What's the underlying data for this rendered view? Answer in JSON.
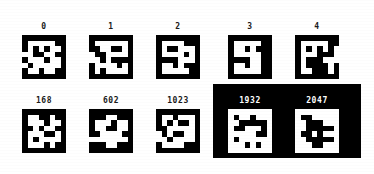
{
  "figure": {
    "background_color": "#ffffff",
    "foreground_color": "#000000",
    "panel_color": "#000000",
    "label_color": "#1a1a1a",
    "panel_label_color": "#ffffff",
    "tile_size_px": 44,
    "bit_grid": 8,
    "rows": 2,
    "columns": 5
  },
  "chart_data": {
    "type": "heatmap",
    "title": "",
    "xlabel": "",
    "ylabel": "",
    "grid": false,
    "legend": "none",
    "colormap": [
      "#000000",
      "#ffffff"
    ],
    "tiles": [
      {
        "label": "0",
        "index": 0,
        "row": 0,
        "column": 0,
        "inverted": false,
        "on_panel": false,
        "matrix": [
          [
            0,
            0,
            0,
            0,
            0,
            0,
            0,
            0
          ],
          [
            0,
            1,
            1,
            1,
            1,
            1,
            0,
            0
          ],
          [
            0,
            1,
            0,
            1,
            0,
            1,
            1,
            0
          ],
          [
            1,
            1,
            0,
            0,
            1,
            1,
            0,
            0
          ],
          [
            0,
            1,
            1,
            1,
            0,
            1,
            1,
            0
          ],
          [
            1,
            0,
            1,
            1,
            1,
            1,
            1,
            0
          ],
          [
            0,
            1,
            1,
            0,
            1,
            1,
            0,
            0
          ],
          [
            0,
            0,
            0,
            0,
            0,
            0,
            0,
            0
          ]
        ]
      },
      {
        "label": "1",
        "index": 1,
        "row": 0,
        "column": 1,
        "inverted": false,
        "on_panel": false,
        "matrix": [
          [
            0,
            0,
            0,
            0,
            0,
            0,
            0,
            0
          ],
          [
            0,
            1,
            1,
            1,
            1,
            1,
            1,
            0
          ],
          [
            0,
            0,
            1,
            1,
            0,
            0,
            1,
            0
          ],
          [
            1,
            0,
            0,
            1,
            1,
            1,
            1,
            0
          ],
          [
            1,
            1,
            0,
            1,
            0,
            0,
            0,
            0
          ],
          [
            0,
            1,
            1,
            1,
            1,
            0,
            1,
            0
          ],
          [
            0,
            1,
            0,
            1,
            1,
            1,
            1,
            0
          ],
          [
            0,
            0,
            0,
            0,
            0,
            0,
            0,
            0
          ]
        ]
      },
      {
        "label": "2",
        "index": 2,
        "row": 0,
        "column": 2,
        "inverted": false,
        "on_panel": false,
        "matrix": [
          [
            0,
            0,
            0,
            0,
            0,
            0,
            0,
            0
          ],
          [
            0,
            1,
            1,
            1,
            1,
            0,
            0,
            0
          ],
          [
            0,
            1,
            0,
            0,
            1,
            1,
            1,
            0
          ],
          [
            0,
            1,
            1,
            1,
            1,
            0,
            1,
            0
          ],
          [
            0,
            0,
            0,
            0,
            1,
            1,
            1,
            0
          ],
          [
            0,
            1,
            1,
            0,
            1,
            0,
            0,
            0
          ],
          [
            0,
            1,
            1,
            1,
            1,
            1,
            0,
            0
          ],
          [
            0,
            0,
            0,
            0,
            0,
            0,
            0,
            0
          ]
        ]
      },
      {
        "label": "3",
        "index": 3,
        "row": 0,
        "column": 3,
        "inverted": false,
        "on_panel": false,
        "matrix": [
          [
            0,
            0,
            0,
            0,
            0,
            0,
            0,
            0
          ],
          [
            0,
            1,
            1,
            1,
            1,
            1,
            0,
            0
          ],
          [
            0,
            1,
            1,
            0,
            1,
            0,
            0,
            0
          ],
          [
            0,
            1,
            1,
            1,
            1,
            1,
            0,
            0
          ],
          [
            0,
            0,
            0,
            0,
            1,
            1,
            0,
            0
          ],
          [
            0,
            1,
            1,
            0,
            1,
            1,
            0,
            0
          ],
          [
            0,
            1,
            1,
            1,
            1,
            1,
            0,
            0
          ],
          [
            0,
            0,
            0,
            0,
            0,
            0,
            0,
            0
          ]
        ]
      },
      {
        "label": "4",
        "index": 4,
        "row": 0,
        "column": 4,
        "inverted": false,
        "on_panel": false,
        "matrix": [
          [
            0,
            0,
            0,
            0,
            0,
            0,
            0,
            0
          ],
          [
            0,
            1,
            1,
            1,
            1,
            1,
            0,
            0
          ],
          [
            0,
            1,
            0,
            1,
            0,
            1,
            0,
            1
          ],
          [
            0,
            1,
            1,
            1,
            0,
            0,
            0,
            1
          ],
          [
            0,
            1,
            0,
            0,
            0,
            1,
            1,
            1
          ],
          [
            0,
            1,
            0,
            0,
            0,
            0,
            1,
            0
          ],
          [
            0,
            1,
            1,
            0,
            0,
            0,
            1,
            0
          ],
          [
            0,
            0,
            0,
            0,
            0,
            0,
            0,
            0
          ]
        ]
      },
      {
        "label": "168",
        "index": 168,
        "row": 1,
        "column": 0,
        "inverted": false,
        "on_panel": false,
        "matrix": [
          [
            0,
            0,
            0,
            0,
            0,
            0,
            0,
            0
          ],
          [
            0,
            1,
            1,
            0,
            0,
            1,
            0,
            0
          ],
          [
            0,
            1,
            1,
            1,
            0,
            1,
            1,
            0
          ],
          [
            0,
            0,
            1,
            0,
            1,
            1,
            0,
            0
          ],
          [
            0,
            1,
            1,
            1,
            0,
            0,
            1,
            0
          ],
          [
            0,
            1,
            0,
            1,
            1,
            1,
            1,
            0
          ],
          [
            0,
            1,
            1,
            1,
            0,
            1,
            0,
            0
          ],
          [
            0,
            0,
            0,
            0,
            0,
            0,
            0,
            0
          ]
        ]
      },
      {
        "label": "602",
        "index": 602,
        "row": 1,
        "column": 1,
        "inverted": false,
        "on_panel": false,
        "matrix": [
          [
            0,
            0,
            0,
            0,
            0,
            0,
            0,
            0
          ],
          [
            0,
            0,
            0,
            1,
            1,
            0,
            0,
            0
          ],
          [
            0,
            1,
            1,
            1,
            0,
            1,
            1,
            0
          ],
          [
            0,
            1,
            1,
            0,
            0,
            1,
            1,
            0
          ],
          [
            0,
            0,
            1,
            1,
            1,
            1,
            0,
            0
          ],
          [
            1,
            1,
            1,
            1,
            1,
            1,
            1,
            0
          ],
          [
            0,
            0,
            0,
            1,
            1,
            0,
            0,
            0
          ],
          [
            0,
            0,
            0,
            0,
            0,
            0,
            0,
            0
          ]
        ]
      },
      {
        "label": "1023",
        "index": 1023,
        "row": 1,
        "column": 2,
        "inverted": false,
        "on_panel": false,
        "matrix": [
          [
            0,
            0,
            0,
            0,
            0,
            0,
            0,
            0
          ],
          [
            0,
            1,
            1,
            0,
            1,
            1,
            1,
            0
          ],
          [
            0,
            1,
            0,
            1,
            0,
            0,
            1,
            0
          ],
          [
            0,
            0,
            1,
            1,
            1,
            1,
            1,
            0
          ],
          [
            1,
            0,
            1,
            0,
            0,
            1,
            1,
            0
          ],
          [
            1,
            1,
            0,
            1,
            1,
            1,
            1,
            0
          ],
          [
            0,
            1,
            1,
            1,
            1,
            0,
            0,
            0
          ],
          [
            0,
            0,
            0,
            0,
            0,
            0,
            0,
            0
          ]
        ]
      },
      {
        "label": "1932",
        "index": 1932,
        "row": 1,
        "column": 3,
        "inverted": true,
        "on_panel": true,
        "matrix": [
          [
            0,
            0,
            0,
            0,
            0,
            0,
            0,
            0
          ],
          [
            0,
            1,
            0,
            0,
            1,
            0,
            0,
            0
          ],
          [
            0,
            0,
            1,
            1,
            1,
            1,
            1,
            0
          ],
          [
            0,
            1,
            1,
            0,
            0,
            0,
            1,
            0
          ],
          [
            0,
            0,
            0,
            0,
            0,
            1,
            1,
            0
          ],
          [
            0,
            1,
            0,
            0,
            0,
            0,
            0,
            0
          ],
          [
            0,
            0,
            0,
            1,
            0,
            1,
            0,
            0
          ],
          [
            0,
            0,
            0,
            0,
            0,
            0,
            0,
            0
          ]
        ]
      },
      {
        "label": "2047",
        "index": 2047,
        "row": 1,
        "column": 4,
        "inverted": true,
        "on_panel": true,
        "matrix": [
          [
            0,
            0,
            0,
            0,
            0,
            0,
            0,
            0
          ],
          [
            0,
            1,
            1,
            0,
            0,
            0,
            0,
            0
          ],
          [
            0,
            0,
            1,
            1,
            1,
            0,
            0,
            0
          ],
          [
            0,
            0,
            1,
            1,
            1,
            1,
            1,
            0
          ],
          [
            0,
            1,
            1,
            0,
            1,
            0,
            0,
            0
          ],
          [
            0,
            0,
            1,
            1,
            1,
            1,
            1,
            0
          ],
          [
            0,
            0,
            0,
            1,
            1,
            0,
            0,
            0
          ],
          [
            0,
            0,
            0,
            0,
            0,
            0,
            0,
            0
          ]
        ]
      }
    ]
  }
}
